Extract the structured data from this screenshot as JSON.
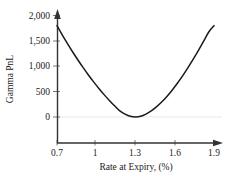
{
  "chart_data": {
    "type": "line",
    "title": "",
    "xlabel": "Rate at Expiry, (%)",
    "ylabel": "Gamma PnL",
    "xlim": [
      0.7,
      1.9
    ],
    "ylim": [
      -170,
      2000
    ],
    "grid": false,
    "legend": null,
    "zero_line": true,
    "xticks": [
      0.7,
      1.0,
      1.3,
      1.6,
      1.9
    ],
    "xtick_labels": [
      "0.7",
      "1",
      "1.3",
      "1.6",
      "1.9"
    ],
    "yticks": [
      0,
      500,
      1000,
      1500,
      2000
    ],
    "ytick_labels": [
      "0",
      "500",
      "1,000",
      "1,500",
      "2,000"
    ],
    "series": [
      {
        "name": "Gamma PnL",
        "color": "#1a1a1a",
        "x": [
          0.7,
          0.74,
          0.78,
          0.82,
          0.86,
          0.9,
          0.94,
          0.98,
          1.02,
          1.06,
          1.1,
          1.14,
          1.18,
          1.22,
          1.26,
          1.3,
          1.34,
          1.38,
          1.42,
          1.46,
          1.5,
          1.54,
          1.58,
          1.62,
          1.66,
          1.7,
          1.74,
          1.78,
          1.82,
          1.86,
          1.9
        ],
        "y": [
          1800,
          1620,
          1447,
          1281,
          1123,
          972,
          828,
          692,
          563,
          441,
          327,
          220,
          121,
          58,
          14,
          0,
          14,
          58,
          121,
          200,
          295,
          405,
          528,
          664,
          811,
          968,
          1134,
          1308,
          1489,
          1675,
          1800
        ]
      }
    ],
    "minimum": {
      "x": 1.3,
      "y": 0
    },
    "endpoints": [
      {
        "x": 0.7,
        "y": 1800
      },
      {
        "x": 1.9,
        "y": 1800
      }
    ]
  },
  "axes": {
    "y_axis_name": "Gamma PnL",
    "x_axis_name": "Rate at Expiry, (%)",
    "arrowheads": "both"
  },
  "colors": {
    "curve": "#1a1a1a",
    "axis": "#333333",
    "zero_line": "#e9e9e9",
    "text": "#1a1a1a",
    "background": "#ffffff"
  }
}
